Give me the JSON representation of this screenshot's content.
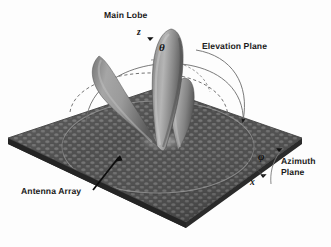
{
  "figure": {
    "kind": "antenna-radiation-pattern-3d-diagram",
    "background_color": "#fdfdfd",
    "ink_color": "#1c1c1c"
  },
  "labels": {
    "main_lobe": "Main Lobe",
    "elevation_plane": "Elevation Plane",
    "azimuth_plane_line1": "Azimuth",
    "azimuth_plane_line2": "Plane",
    "antenna_array": "Antenna Array"
  },
  "symbols": {
    "theta": "θ",
    "phi": "φ",
    "z_axis": "z",
    "x_axis": "x"
  },
  "colors": {
    "array_base": "#4a4a4a",
    "array_element_light": "#6d6d6d",
    "array_edge_dark": "#2f2f2f",
    "lobe_light": "#b9b9b9",
    "lobe_mid": "#8d8d8d",
    "lobe_dark": "#5d5d5d",
    "arc_line": "#6b6b6b",
    "pointer_line": "#111111",
    "circle_outline": "#8a8a8a"
  },
  "geometry": {
    "plane_vertices_px": [
      {
        "name": "left",
        "x": 8,
        "y": 138
      },
      {
        "name": "top",
        "x": 158,
        "y": 88
      },
      {
        "name": "right",
        "x": 302,
        "y": 138
      },
      {
        "name": "bottom",
        "x": 186,
        "y": 222
      }
    ],
    "plane_thickness_px": 6,
    "array_origin_px": {
      "x": 160,
      "y": 141
    },
    "z_axis_tip_px": {
      "x": 152,
      "y": 36
    },
    "lobes": [
      {
        "name": "main-lobe",
        "tip_x": 172,
        "tip_y": 30,
        "base_x": 160,
        "base_y": 145,
        "width": 22,
        "tilt_deg": 4
      },
      {
        "name": "left-side-lobe",
        "tip_x": 95,
        "tip_y": 57,
        "base_x": 156,
        "base_y": 147,
        "width": 17,
        "tilt_deg": -28
      },
      {
        "name": "right-side-lobe",
        "tip_x": 186,
        "tip_y": 78,
        "base_x": 170,
        "base_y": 144,
        "width": 16,
        "tilt_deg": 8
      }
    ],
    "elevation_arcs": 3,
    "azimuth_arc": {
      "start_x": 279,
      "start_y": 148,
      "end_x": 272,
      "end_y": 183
    },
    "pointer_antenna_array": {
      "from_x": 92,
      "from_y": 190,
      "to_x": 118,
      "to_y": 158
    }
  }
}
